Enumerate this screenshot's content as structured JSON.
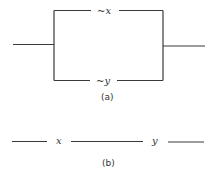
{
  "figure_a": {
    "caption": "(a)",
    "description": "Parallel switching circuit",
    "branches": [
      {
        "label": "~x",
        "position": "top"
      },
      {
        "label": "~y",
        "position": "bottom"
      }
    ]
  },
  "figure_b": {
    "caption": "(b)",
    "description": "Series switching circuit",
    "switches": [
      {
        "label": "x"
      },
      {
        "label": "y"
      }
    ]
  }
}
